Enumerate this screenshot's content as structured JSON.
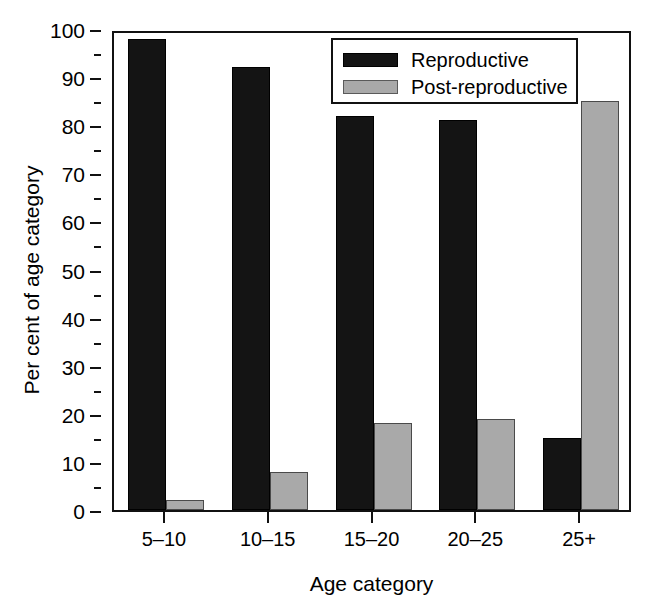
{
  "chart_data": {
    "type": "bar",
    "title": "",
    "xlabel": "Age category",
    "ylabel": "Per cent of age category",
    "categories": [
      "5–10",
      "10–15",
      "15–20",
      "20–25",
      "25+"
    ],
    "series": [
      {
        "name": "Reproductive",
        "color": "#141414",
        "values": [
          98,
          92,
          82,
          81,
          15
        ]
      },
      {
        "name": "Post-reproductive",
        "color": "#a9a9a9",
        "values": [
          2,
          8,
          18,
          19,
          85
        ]
      }
    ],
    "ylim": [
      0,
      100
    ],
    "ytick_major": [
      0,
      10,
      20,
      30,
      40,
      50,
      60,
      70,
      80,
      90,
      100
    ],
    "ytick_minor": [
      5,
      15,
      25,
      35,
      45,
      55,
      65,
      75,
      85,
      95
    ],
    "ytick_labels": [
      "0",
      "10",
      "20",
      "30",
      "40",
      "50",
      "60",
      "70",
      "80",
      "90",
      "100"
    ],
    "grid": false,
    "legend_position": "top-right"
  },
  "axes": {
    "x_title": "Age category",
    "y_title": "Per cent of age category"
  },
  "legend": {
    "entries": [
      {
        "label": "Reproductive",
        "swatch": "black"
      },
      {
        "label": "Post-reproductive",
        "swatch": "gray"
      }
    ]
  }
}
